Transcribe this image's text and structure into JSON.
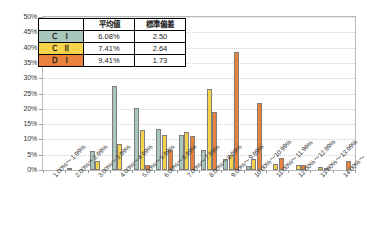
{
  "chart_data": {
    "type": "bar",
    "title": "",
    "xlabel": "",
    "ylabel": "",
    "ylim": [
      0,
      50
    ],
    "grid": true,
    "legend_position": "inside-top-left",
    "categories": [
      "1.00%～1.99%",
      "2.00%～2.99%",
      "3.00%～3.99%",
      "4.00%～4.99%",
      "5.00%～5.99%",
      "6.00%～6.99%",
      "7.00%～7.99%",
      "8.00%～8.99%",
      "9.00%～9.99%",
      "10.00%～10.99%",
      "11.00%～11.99%",
      "12.00%～12.99%",
      "13.00%～13.99%",
      "14.00%～"
    ],
    "y_ticks": [
      "0%",
      "5%",
      "10%",
      "15%",
      "20%",
      "25%",
      "30%",
      "35%",
      "40%",
      "45%",
      "50%"
    ],
    "y_tick_values": [
      0,
      5,
      10,
      15,
      20,
      25,
      30,
      35,
      40,
      45,
      50
    ],
    "series": [
      {
        "name": "Ｃ Ⅰ",
        "color": "#a9c6bd",
        "values": [
          0,
          0.6,
          6.3,
          27.3,
          20.3,
          13.5,
          11.5,
          6.5,
          3.5,
          1.2,
          0,
          0,
          0,
          0
        ]
      },
      {
        "name": "Ｃ Ⅱ",
        "color": "#f6d34a",
        "values": [
          0,
          0,
          3.0,
          8.5,
          13.0,
          11.5,
          12.5,
          26.5,
          5.0,
          3.5,
          2.0,
          1.5,
          1.0,
          0
        ]
      },
      {
        "name": "Ｄ Ⅰ",
        "color": "#e9823d",
        "values": [
          0,
          0,
          0,
          0,
          1.7,
          6.5,
          11.0,
          19.0,
          38.5,
          22.0,
          4.0,
          1.5,
          0.5,
          3.0
        ]
      }
    ]
  },
  "stats_table": {
    "headers": [
      "",
      "平均値",
      "標準偏差"
    ],
    "rows": [
      {
        "name": "Ｃ Ⅰ",
        "mean": "6.08%",
        "sd": "2.50",
        "color": "#a9c6bd"
      },
      {
        "name": "Ｃ Ⅱ",
        "mean": "7.41%",
        "sd": "2.64",
        "color": "#f6d34a"
      },
      {
        "name": "Ｄ Ⅰ",
        "mean": "9.41%",
        "sd": "1.73",
        "color": "#e9823d"
      }
    ]
  },
  "colors": {
    "series_1": "#a9c6bd",
    "series_2": "#f6d34a",
    "series_3": "#e9823d",
    "bar_border": "#7d7d7d",
    "axis": "#b9b9b9",
    "grid": "#cfcfcf",
    "text": "#333333"
  }
}
